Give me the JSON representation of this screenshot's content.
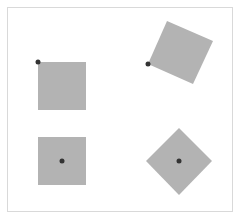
{
  "diagram": {
    "colors": {
      "background": "#ffffff",
      "frame_border": "#d9d9d9",
      "square_fill": "#b3b3b3",
      "origin_dot": "#333333"
    },
    "square_size": 48,
    "shapes": [
      {
        "id": "top-left",
        "x": 38,
        "y": 62,
        "rotation_deg": 0,
        "origin": "top-left",
        "origin_x": 38,
        "origin_y": 62
      },
      {
        "id": "top-right",
        "x": 148,
        "y": 64,
        "rotation_deg": -66,
        "origin": "top-left",
        "origin_x": 148,
        "origin_y": 64
      },
      {
        "id": "bottom-left",
        "x": 38,
        "y": 137,
        "rotation_deg": 0,
        "origin": "center",
        "origin_x": 62,
        "origin_y": 161
      },
      {
        "id": "bottom-right",
        "x": 155,
        "y": 137,
        "rotation_deg": 45,
        "origin": "center",
        "origin_x": 179,
        "origin_y": 161
      }
    ]
  }
}
